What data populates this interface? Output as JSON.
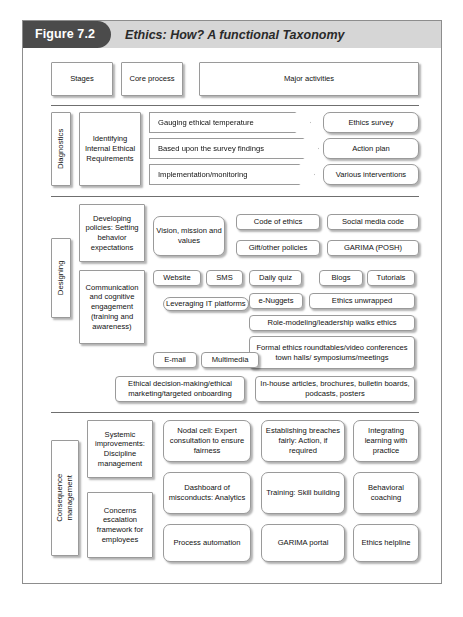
{
  "figure": {
    "badge": "Figure 7.2",
    "title": "Ethics: How? A functional Taxonomy",
    "colors": {
      "badge_bg": "#4b4b4b",
      "header_bg": "#d6d6d6",
      "frame_border": "#8d8d8d",
      "box_border": "#9a9a9a",
      "text": "#111111"
    }
  },
  "column_headers": {
    "stages": "Stages",
    "core_process": "Core process",
    "major_activities": "Major activities"
  },
  "sections": [
    {
      "stage": "Diagnostics",
      "core_process": [
        "Identifying Internal Ethical Requirements"
      ],
      "arrows": [
        "Gauging ethical temperature",
        "Based upon the survey findings",
        "Implementation/monitoring"
      ],
      "outcomes": [
        "Ethics survey",
        "Action plan",
        "Various interventions"
      ]
    },
    {
      "stage": "Designing",
      "core_process": [
        "Developing policies: Setting behavior expectations",
        "Communication and cognitive engagement (training and awareness)"
      ],
      "enablers": [
        "Vision, mission and values",
        "Leveraging IT platforms"
      ],
      "activities": [
        "Code of ethics",
        "Social media code",
        "Gift/other policies",
        "GARIMA (POSH)",
        "Website",
        "SMS",
        "Daily quiz",
        "Blogs",
        "Tutorials",
        "e-Nuggets",
        "Ethics unwrapped",
        "Role-modeling/leadership walks ethics",
        "E-mail",
        "Multimedia",
        "Formal ethics roundtables/video conferences town halls/ symposiums/meetings",
        "Ethical decision-making/ethical marketing/targeted onboarding",
        "In-house articles, brochures, bulletin boards, podcasts, posters"
      ]
    },
    {
      "stage": "Consequence management",
      "core_process": [
        "Systemic improvements: Discipline management",
        "Concerns escalation framework for employees"
      ],
      "activities": [
        "Nodal cell: Expert consultation to ensure fairness",
        "Establishing breaches fairly: Action, if required",
        "Integrating learning with practice",
        "Dashboard of misconducts: Analytics",
        "Training: Skill building",
        "Behavioral coaching",
        "Process automation",
        "GARIMA portal",
        "Ethics helpline"
      ]
    }
  ]
}
